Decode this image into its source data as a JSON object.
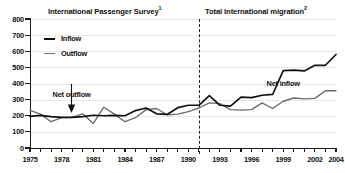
{
  "chart_data": {
    "type": "line",
    "title": "",
    "panel_titles": [
      {
        "label": "International Passenger Survey",
        "superscript": "1"
      },
      {
        "label": "Total International migration",
        "superscript": "2"
      }
    ],
    "xlabel": "",
    "ylabel": "",
    "ylim": [
      0,
      800
    ],
    "ytick_labels": [
      "800",
      "700",
      "600",
      "500",
      "400",
      "300",
      "200",
      "100",
      "0"
    ],
    "ytick_values": [
      800,
      700,
      600,
      500,
      400,
      300,
      200,
      100,
      0
    ],
    "xlim": [
      1975,
      2004
    ],
    "xtick_labels": [
      "1975",
      "1978",
      "1981",
      "1984",
      "1987",
      "1990",
      "1993",
      "1996",
      "1999",
      "2002",
      "2004"
    ],
    "xtick_values": [
      1975,
      1978,
      1981,
      1984,
      1987,
      1990,
      1993,
      1996,
      1999,
      2002,
      2004
    ],
    "grid": true,
    "legend_position": "top-left",
    "divider_year": 1991,
    "x": [
      1975,
      1976,
      1977,
      1978,
      1979,
      1980,
      1981,
      1982,
      1983,
      1984,
      1985,
      1986,
      1987,
      1988,
      1989,
      1990,
      1991,
      1992,
      1993,
      1994,
      1995,
      1996,
      1997,
      1998,
      1999,
      2000,
      2001,
      2002,
      2003,
      2004
    ],
    "series": [
      {
        "name": "Inflow",
        "color": "#111111",
        "values": [
          196,
          202,
          195,
          190,
          190,
          195,
          203,
          200,
          202,
          200,
          232,
          248,
          212,
          208,
          250,
          265,
          265,
          325,
          265,
          260,
          315,
          312,
          327,
          332,
          480,
          483,
          478,
          513,
          513,
          580
        ]
      },
      {
        "name": "Outflow",
        "color": "#6b6b6b",
        "values": [
          233,
          210,
          163,
          188,
          190,
          212,
          152,
          253,
          210,
          163,
          188,
          238,
          245,
          205,
          210,
          226,
          248,
          280,
          275,
          238,
          235,
          238,
          280,
          245,
          290,
          310,
          305,
          308,
          355,
          355
        ]
      }
    ],
    "annotations": [
      {
        "text": "Net outflow",
        "x": 1979.5,
        "y": 330
      },
      {
        "text": "Net inflow",
        "x": 1999.5,
        "y": 395
      }
    ]
  }
}
